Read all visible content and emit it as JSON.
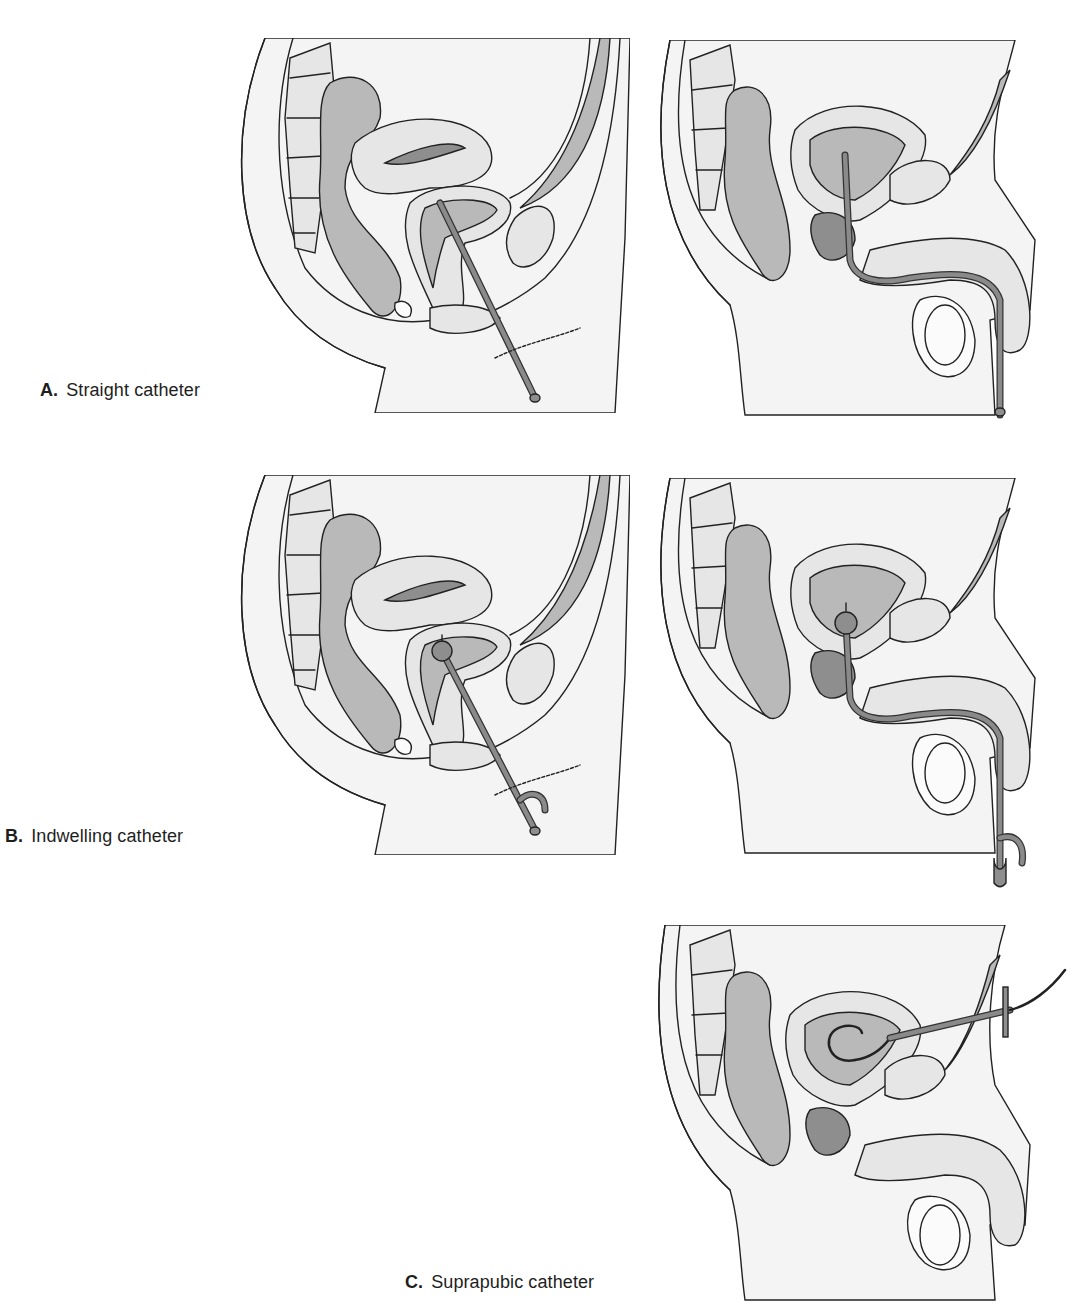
{
  "figure": {
    "rows": [
      {
        "id": "A",
        "letter": "A.",
        "label": "Straight catheter",
        "panels": [
          {
            "subject": "female pelvis sagittal section",
            "catheter": "straight",
            "icon": "female-pelvis-straight-catheter-icon"
          },
          {
            "subject": "male pelvis sagittal section",
            "catheter": "straight",
            "icon": "male-pelvis-straight-catheter-icon"
          }
        ]
      },
      {
        "id": "B",
        "letter": "B.",
        "label": "Indwelling catheter",
        "panels": [
          {
            "subject": "female pelvis sagittal section",
            "catheter": "indwelling (balloon + side port)",
            "icon": "female-pelvis-indwelling-catheter-icon"
          },
          {
            "subject": "male pelvis sagittal section",
            "catheter": "indwelling (balloon + side port)",
            "icon": "male-pelvis-indwelling-catheter-icon"
          }
        ]
      },
      {
        "id": "C",
        "letter": "C.",
        "label": "Suprapubic catheter",
        "panels": [
          {
            "subject": "male pelvis sagittal section",
            "catheter": "suprapubic (through abdominal wall)",
            "icon": "male-pelvis-suprapubic-catheter-icon"
          }
        ]
      }
    ],
    "colors": {
      "background": "#ffffff",
      "outline": "#222222",
      "tissue_light": "#e6e6e6",
      "tissue_mid": "#b9b9b9",
      "tissue_dark": "#8e8e8e",
      "catheter": "#8a8a8a",
      "label_text": "#1e1e1e"
    }
  }
}
